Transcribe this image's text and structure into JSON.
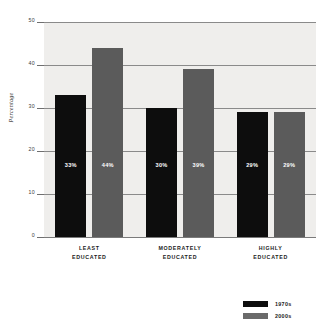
{
  "chart_data": {
    "type": "bar",
    "title": "",
    "subtitle": "",
    "xlabel": "",
    "ylabel": "Percentage",
    "ylim": [
      0,
      50
    ],
    "yticks": [
      0,
      10,
      20,
      30,
      40,
      50
    ],
    "ytick_labels": [
      "0",
      "10",
      "20",
      "30",
      "40",
      "50"
    ],
    "grid": true,
    "grid_axis": "y",
    "legend_position": "bottom-right",
    "categories": [
      "LEAST EDUCATED",
      "MODERATELY EDUCATED",
      "HIGHLY EDUCATED"
    ],
    "category_lines": [
      [
        "LEAST",
        "EDUCATED"
      ],
      [
        "MODERATELY",
        "EDUCATED"
      ],
      [
        "HIGHLY",
        "EDUCATED"
      ]
    ],
    "series": [
      {
        "name": "1970s",
        "color": "#0d0d0d",
        "values": [
          33,
          30,
          29
        ],
        "data_labels": [
          "33%",
          "30%",
          "29%"
        ]
      },
      {
        "name": "2000s",
        "color": "#5b5b5b",
        "values": [
          44,
          39,
          29
        ],
        "data_labels": [
          "44%",
          "39%",
          "29%"
        ]
      }
    ]
  },
  "legend": {
    "items": [
      {
        "label": "1970s",
        "color": "#0d0d0d"
      },
      {
        "label": "2000s",
        "color": "#6a6a6a"
      }
    ]
  }
}
